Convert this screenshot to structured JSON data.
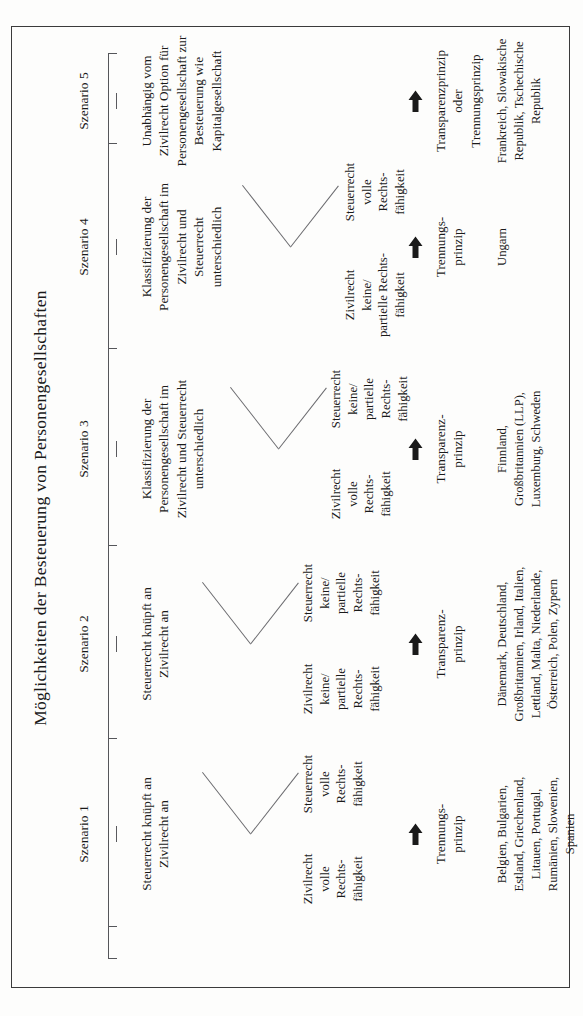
{
  "figure": {
    "title": "Möglichkeiten der Besteuerung von Personengesellschaften",
    "orientation": "rotated-90-ccw",
    "frame_color": "#3b3b3b"
  },
  "axis": {
    "label_prefix": "Szenario"
  },
  "scenarios": [
    {
      "id": "szenario-1",
      "label": "Szenario 1",
      "description": "Steuerrecht knüpft an\nZivilrecht an",
      "conditions": [
        "Zivilrecht\nvolle\nRechts-\nfähigkeit",
        "Steuerrecht\nvolle\nRechts-\nfähigkeit"
      ],
      "has_fork": true,
      "arrow": "right-arrow-icon",
      "principle": "Trennungs-\nprinzip",
      "countries": "Belgien, Bulgarien,\nEstland, Griechenland,\nLitauen, Portugal,\nRumänien, Slowenien,\nSpanien"
    },
    {
      "id": "szenario-2",
      "label": "Szenario 2",
      "description": "Steuerrecht knüpft an\nZivilrecht an",
      "conditions": [
        "Zivilrecht\nkeine/\npartielle\nRechts-\nfähigkeit",
        "Steuerrecht\nkeine/\npartielle\nRechts-\nfähigkeit"
      ],
      "has_fork": true,
      "arrow": "right-arrow-icon",
      "principle": "Transparenz-\nprinzip",
      "countries": "Dänemark, Deutschland,\nGroßbritannien, Irland, Italien,\nLettland, Malta, Niederlande,\nÖsterreich, Polen, Zypern"
    },
    {
      "id": "szenario-3",
      "label": "Szenario 3",
      "description": "Klassifizierung der\nPersonengesellschaft im\nZivilrecht und Steuerrecht\nunterschiedlich",
      "conditions": [
        "Zivilrecht\nvolle\nRechts-\nfähigkeit",
        "Steuerrecht\nkeine/\npartielle\nRechts-\nfähigkeit"
      ],
      "has_fork": true,
      "arrow": "right-arrow-icon",
      "principle": "Transparenz-\nprinzip",
      "countries": "Finnland,\nGroßbritannien (LLP),\nLuxemburg, Schweden"
    },
    {
      "id": "szenario-4",
      "label": "Szenario 4",
      "description": "Klassifizierung der\nPersonengesellschaft im\nZivilrecht und\nSteuerrecht\nunterschiedlich",
      "conditions": [
        "Zivilrecht\nkeine/\npartielle Rechts-\nfähigkeit",
        "Steuerrecht\nvolle\nRechts-\nfähigkeit"
      ],
      "has_fork": true,
      "arrow": "right-arrow-icon",
      "principle": "Trennungs-\nprinzip",
      "countries": "Ungarn"
    },
    {
      "id": "szenario-5",
      "label": "Szenario 5",
      "description": "Unabhängig vom\nZivilrecht Option für\nPersonengesellschaft zur\nBesteuerung wie\nKapitalgesellschaft",
      "conditions": [],
      "has_fork": false,
      "arrow": "right-arrow-icon",
      "principle": "Transparenzprinzip\noder\nTrennungsprinzip",
      "countries": "Frankreich, Slowakische\nRepublik, Tschechische\nRepublik"
    }
  ]
}
